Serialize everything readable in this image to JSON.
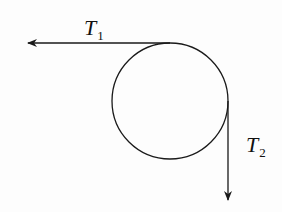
{
  "diagram": {
    "type": "pulley-tension",
    "labels": {
      "t1": {
        "main": "T",
        "sub": "1"
      },
      "t2": {
        "main": "T",
        "sub": "2"
      }
    },
    "colors": {
      "stroke": "#1a1a1a",
      "background": "#fdfdfd"
    }
  }
}
